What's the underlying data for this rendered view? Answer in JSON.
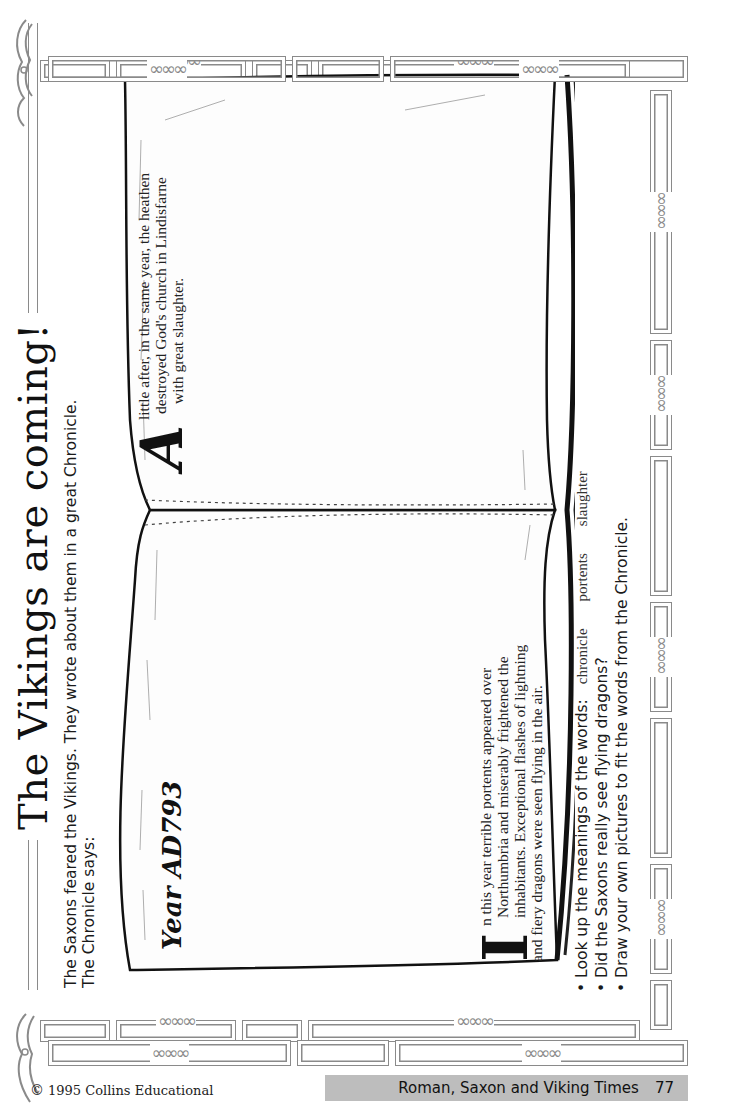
{
  "title": "The Vikings are coming!",
  "intro": {
    "line1": "The Saxons feared the Vikings. They wrote about them in a great Chronicle.",
    "line2": "The Chronicle says:"
  },
  "chronicle": {
    "year_heading": "Year AD793",
    "left_page": {
      "dropcap": "I",
      "lines": [
        "n this year terrible portents appeared over",
        "Northumbria and miserably frightened the",
        "inhabitants. Exceptional flashes of lightning",
        "and fiery dragons were seen flying in the air."
      ]
    },
    "right_page": {
      "dropcap": "A",
      "lines": [
        "little after, in the same year, the heathen",
        "destroyed God's church in Lindisfarne",
        "with great slaughter."
      ]
    }
  },
  "tasks": {
    "items": [
      {
        "bullet": "•",
        "text": "Look up the meanings of the words:"
      },
      {
        "bullet": "•",
        "text": "Did the Saxons really see flying dragons?"
      },
      {
        "bullet": "•",
        "text": "Draw your own pictures to fit the words from the Chronicle."
      }
    ],
    "words": [
      "chronicle",
      "portents",
      "slaughter"
    ]
  },
  "footer": {
    "copyright_symbol": "©",
    "copyright": "1995 Collins Educational",
    "book_title": "Roman, Saxon and Viking Times",
    "page_number": "77"
  },
  "decor": {
    "knot_glyph": "∞∞∞",
    "border_color": "#8a8a8a",
    "banner_color": "#bdbdbd",
    "icons": [
      "celtic-knot-icon",
      "dragon-head-icon",
      "open-book-illustration"
    ]
  }
}
